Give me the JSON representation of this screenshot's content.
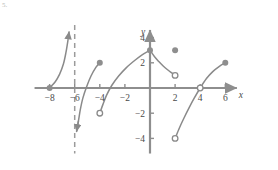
{
  "figure": {
    "label": "5.",
    "background": "#ffffff"
  },
  "chart_data": {
    "type": "line",
    "title": "",
    "xlabel": "x",
    "ylabel": "y",
    "xlim": [
      -9.2,
      7.4
    ],
    "ylim": [
      -5.2,
      5.0
    ],
    "grid": false,
    "legend": null,
    "axis_color": "#8e8e8e",
    "curve_color": "#8a8a8a",
    "dot_color": "#8e8e8e",
    "asymptote_color": "#9b9b9b",
    "xticks": [
      -8,
      -6,
      -4,
      -2,
      2,
      4,
      6
    ],
    "xtick_labels": [
      "−8",
      "−6",
      "−4",
      "−2",
      "2",
      "4",
      "6"
    ],
    "yticks": [
      4,
      2,
      -2,
      -4
    ],
    "ytick_labels": [
      "4",
      "2",
      "−2",
      "−4"
    ],
    "asymptotes": [
      {
        "name": "vertical-asymptote-x-neg6",
        "x": -6,
        "style": "dashed",
        "y_from": -5.2,
        "y_to": 5.0
      }
    ],
    "branches": [
      {
        "name": "branch-1",
        "points": [
          [
            -8,
            0
          ],
          [
            -7.55,
            0.5
          ],
          [
            -7.2,
            1.1
          ],
          [
            -6.9,
            1.9
          ],
          [
            -6.7,
            2.8
          ],
          [
            -6.55,
            3.7
          ],
          [
            -6.45,
            4.45
          ]
        ],
        "start_marker": "filled",
        "end_marker": "arrow-up",
        "start_point": [
          -8,
          0
        ],
        "end_point": [
          -6.45,
          4.45
        ]
      },
      {
        "name": "branch-2",
        "points": [
          [
            -5.85,
            -3.45
          ],
          [
            -5.7,
            -2.6
          ],
          [
            -5.55,
            -1.7
          ],
          [
            -5.35,
            -0.8
          ],
          [
            -5.05,
            0.1
          ],
          [
            -4.7,
            0.95
          ],
          [
            -4.3,
            1.65
          ],
          [
            -4,
            2
          ]
        ],
        "start_marker": "arrow-down",
        "end_marker": "filled",
        "start_point": [
          -5.85,
          -3.45
        ],
        "end_point": [
          -4,
          2
        ]
      },
      {
        "name": "branch-3",
        "points": [
          [
            -4,
            -2
          ],
          [
            -3.75,
            -1.3
          ],
          [
            -3.45,
            -0.55
          ],
          [
            -3.05,
            0.2
          ],
          [
            -2.5,
            0.95
          ],
          [
            -1.9,
            1.6
          ],
          [
            -1.2,
            2.2
          ],
          [
            -0.6,
            2.65
          ],
          [
            0,
            3
          ]
        ],
        "start_marker": "open",
        "end_marker": "filled",
        "start_point": [
          -4,
          -2
        ],
        "end_point": [
          0,
          3
        ]
      },
      {
        "name": "branch-4",
        "points": [
          [
            0,
            3
          ],
          [
            0.35,
            2.5
          ],
          [
            0.7,
            2.1
          ],
          [
            1.05,
            1.75
          ],
          [
            1.4,
            1.45
          ],
          [
            1.7,
            1.22
          ],
          [
            2,
            1
          ]
        ],
        "start_marker": "filled",
        "end_marker": "open",
        "start_point": [
          0,
          3
        ],
        "end_point": [
          2,
          1
        ]
      },
      {
        "name": "branch-5",
        "points": [
          [
            2,
            -4
          ],
          [
            2.35,
            -3.15
          ],
          [
            2.7,
            -2.4
          ],
          [
            3.1,
            -1.6
          ],
          [
            3.5,
            -0.85
          ],
          [
            4,
            0
          ],
          [
            4.5,
            0.75
          ],
          [
            5,
            1.3
          ],
          [
            5.5,
            1.7
          ],
          [
            6,
            2
          ]
        ],
        "start_marker": "open",
        "mid_marker": "open",
        "mid_point": [
          4,
          0
        ],
        "end_marker": "filled",
        "start_point": [
          2,
          -4
        ],
        "end_point": [
          6,
          2
        ]
      }
    ],
    "isolated_points": [
      {
        "name": "isolated-point-2-3",
        "x": 2,
        "y": 3,
        "marker": "filled"
      }
    ],
    "filled_points": [
      {
        "name": "point-neg8-0",
        "x": -8,
        "y": 0
      },
      {
        "name": "point-neg4-2",
        "x": -4,
        "y": 2
      },
      {
        "name": "point-0-3",
        "x": 0,
        "y": 3
      },
      {
        "name": "point-2-3",
        "x": 2,
        "y": 3
      },
      {
        "name": "point-6-2",
        "x": 6,
        "y": 2
      }
    ],
    "open_points": [
      {
        "name": "point-neg4-neg2",
        "x": -4,
        "y": -2
      },
      {
        "name": "point-2-1",
        "x": 2,
        "y": 1
      },
      {
        "name": "point-4-0",
        "x": 4,
        "y": 0
      },
      {
        "name": "point-2-neg4",
        "x": 2,
        "y": -4
      }
    ]
  }
}
